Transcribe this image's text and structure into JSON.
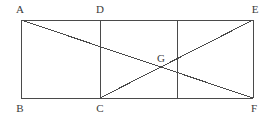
{
  "figure": {
    "type": "geometry-diagram",
    "canvas": {
      "width": 273,
      "height": 119
    },
    "stroke_color": "#4a4a4a",
    "label_color": "#3b3b3b",
    "background_color": "#ffffff",
    "stroke_width": 1,
    "points": [
      {
        "id": "A",
        "label": "A",
        "x": 21,
        "y": 20,
        "label_x": 20,
        "label_y": 9
      },
      {
        "id": "D",
        "label": "D",
        "x": 100,
        "y": 20,
        "label_x": 100,
        "label_y": 9
      },
      {
        "id": "E",
        "label": "E",
        "x": 253,
        "y": 20,
        "label_x": 255,
        "label_y": 9
      },
      {
        "id": "B",
        "label": "B",
        "x": 21,
        "y": 98,
        "label_x": 20,
        "label_y": 108
      },
      {
        "id": "C",
        "label": "C",
        "x": 100,
        "y": 98,
        "label_x": 100,
        "label_y": 108
      },
      {
        "id": "F",
        "label": "F",
        "x": 253,
        "y": 98,
        "label_x": 254,
        "label_y": 108
      },
      {
        "id": "G",
        "label": "G",
        "x": 160,
        "y": 69,
        "label_x": 161,
        "label_y": 58
      }
    ],
    "segments": [
      {
        "name": "top-edge-A-E",
        "x1": 21,
        "y1": 20,
        "x2": 253,
        "y2": 20
      },
      {
        "name": "bottom-edge-B-F",
        "x1": 21,
        "y1": 98,
        "x2": 253,
        "y2": 98
      },
      {
        "name": "left-edge-A-B",
        "x1": 21,
        "y1": 20,
        "x2": 21,
        "y2": 98
      },
      {
        "name": "right-edge-E-F",
        "x1": 253,
        "y1": 20,
        "x2": 253,
        "y2": 98
      },
      {
        "name": "vertical-segment-D-C",
        "x1": 100,
        "y1": 20,
        "x2": 100,
        "y2": 98
      },
      {
        "name": "vertical-segment-mid",
        "x1": 177,
        "y1": 20,
        "x2": 177,
        "y2": 98
      },
      {
        "name": "diagonal-A-F",
        "x1": 21,
        "y1": 20,
        "x2": 253,
        "y2": 98
      },
      {
        "name": "diagonal-C-E",
        "x1": 100,
        "y1": 98,
        "x2": 253,
        "y2": 20
      }
    ]
  }
}
